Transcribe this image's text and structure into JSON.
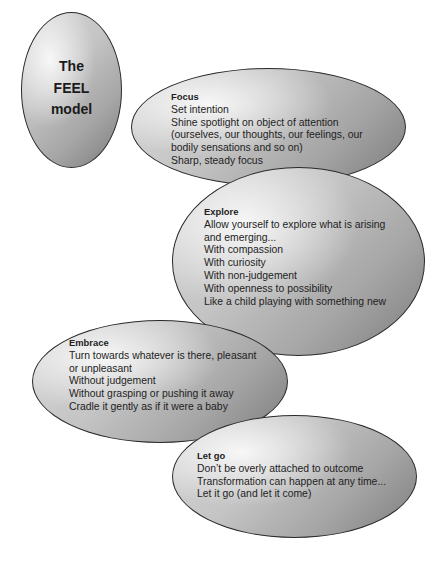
{
  "title": {
    "lines": [
      "The",
      "FEEL",
      "model"
    ]
  },
  "stages": [
    {
      "heading": "Focus",
      "lines": [
        "Set intention",
        "Shine spotlight on object of attention",
        "(ourselves, our thoughts, our feelings, our",
        "bodily sensations and so on)",
        "Sharp, steady focus"
      ]
    },
    {
      "heading": "Explore",
      "lines": [
        "Allow yourself to explore what is arising",
        "and emerging...",
        "With compassion",
        "With curiosity",
        "With non-judgement",
        "With openness to possibility",
        "Like a child playing with something new"
      ]
    },
    {
      "heading": "Embrace",
      "lines": [
        "Turn towards whatever is there, pleasant",
        "or unpleasant",
        "Without judgement",
        "Without grasping or pushing it away",
        "Cradle it gently as if it were a baby"
      ]
    },
    {
      "heading": "Let go",
      "lines": [
        "Don’t be overly attached to outcome",
        "Transformation can happen at any time...",
        "Let it go (and let it come)"
      ]
    }
  ]
}
